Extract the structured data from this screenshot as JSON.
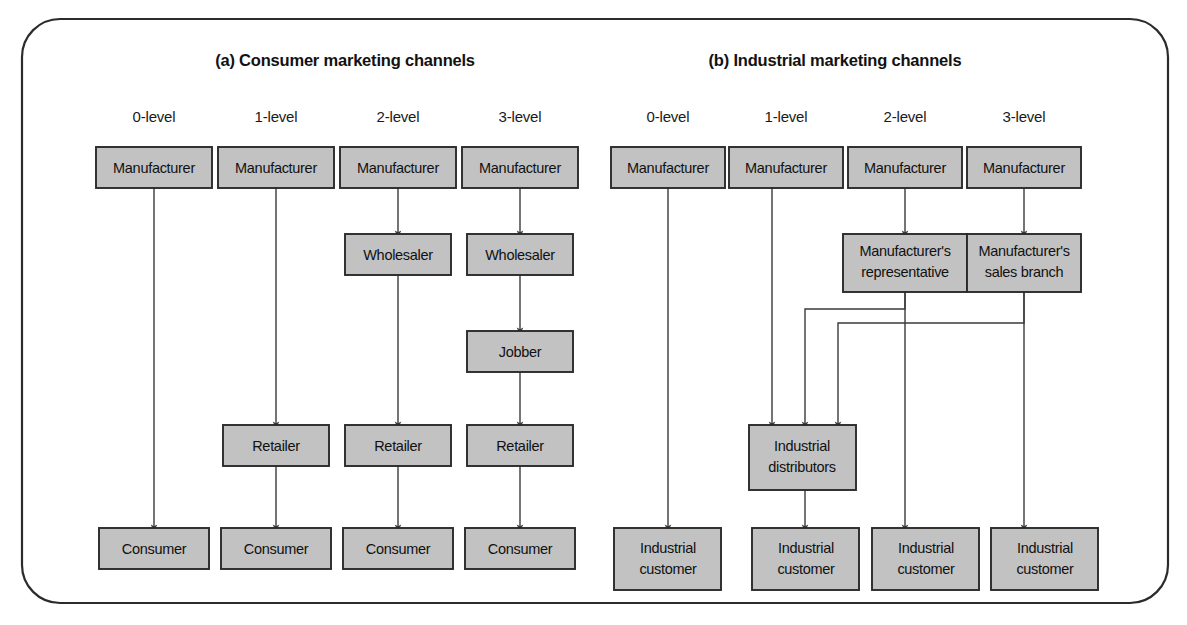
{
  "figure": {
    "panels": [
      {
        "id": "consumer",
        "title": "(a) Consumer marketing channels",
        "level_labels": [
          "0-level",
          "1-level",
          "2-level",
          "3-level"
        ]
      },
      {
        "id": "industrial",
        "title": "(b) Industrial marketing channels",
        "level_labels": [
          "0-level",
          "1-level",
          "2-level",
          "3-level"
        ]
      }
    ],
    "nodes": {
      "manufacturer": "Manufacturer",
      "wholesaler": "Wholesaler",
      "jobber": "Jobber",
      "retailer": "Retailer",
      "consumer": "Consumer",
      "mfr_rep_line1": "Manufacturer's",
      "mfr_rep_line2": "representative",
      "mfr_branch_line1": "Manufacturer's",
      "mfr_branch_line2": "sales branch",
      "ind_dist_line1": "Industrial",
      "ind_dist_line2": "distributors",
      "ind_cust_line1": "Industrial",
      "ind_cust_line2": "customer"
    },
    "chains": {
      "consumer_0": [
        "Manufacturer",
        "Consumer"
      ],
      "consumer_1": [
        "Manufacturer",
        "Retailer",
        "Consumer"
      ],
      "consumer_2": [
        "Manufacturer",
        "Wholesaler",
        "Retailer",
        "Consumer"
      ],
      "consumer_3": [
        "Manufacturer",
        "Wholesaler",
        "Jobber",
        "Retailer",
        "Consumer"
      ],
      "industrial_0": [
        "Manufacturer",
        "Industrial customer"
      ],
      "industrial_1": [
        "Manufacturer",
        "Industrial distributors",
        "Industrial customer"
      ],
      "industrial_2": [
        "Manufacturer",
        "Manufacturer's representative",
        "Industrial distributors",
        "Industrial customer"
      ],
      "industrial_3": [
        "Manufacturer",
        "Manufacturer's sales branch",
        "Industrial distributors",
        "Industrial customer"
      ]
    },
    "colors": {
      "node_fill": "#c2c2c2",
      "node_stroke": "#2a2a2a",
      "line": "#3a3a3a",
      "frame": "#2b2b2b",
      "background": "#ffffff"
    }
  }
}
